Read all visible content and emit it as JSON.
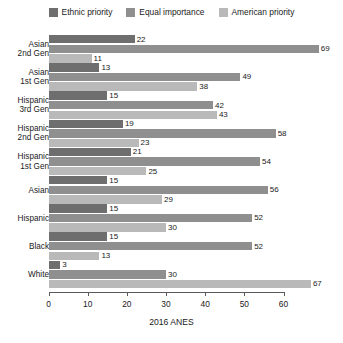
{
  "legend": {
    "position": "top-center",
    "items": [
      {
        "label": "Ethnic priority",
        "color": "#6e6e6e",
        "icon": "square-swatch-icon"
      },
      {
        "label": "Equal importance",
        "color": "#8f8f8f",
        "icon": "square-swatch-icon"
      },
      {
        "label": "American priority",
        "color": "#b9b9b9",
        "icon": "square-swatch-icon"
      }
    ]
  },
  "axis": {
    "title": "2016 ANES",
    "ticks": [
      0,
      10,
      20,
      30,
      40,
      50,
      60
    ],
    "min": 0,
    "max": 60,
    "pixels": {
      "origin_x": 48.5,
      "units_per_px": 3.917
    }
  },
  "chart_data": {
    "type": "bar",
    "orientation": "horizontal",
    "title": "",
    "subtitle": "",
    "xlabel": "2016 ANES",
    "ylabel": "",
    "xlim": [
      0,
      60
    ],
    "grid": false,
    "legend_position": "top-center",
    "categories": [
      "Asian\n2nd Gen",
      "Asian\n1st Gen",
      "Hispanic\n3rd Gen",
      "Hispanic\n2nd Gen",
      "Hispanic\n1st Gen",
      "Asian",
      "Hispanic",
      "Black",
      "White"
    ],
    "series": [
      {
        "name": "Ethnic priority",
        "color": "#6e6e6e",
        "values": [
          22,
          13,
          15,
          19,
          21,
          15,
          15,
          15,
          3
        ]
      },
      {
        "name": "Equal importance",
        "color": "#8f8f8f",
        "values": [
          69,
          49,
          42,
          58,
          54,
          56,
          52,
          52,
          30
        ]
      },
      {
        "name": "American priority",
        "color": "#b9b9b9",
        "values": [
          11,
          38,
          43,
          23,
          25,
          29,
          30,
          13,
          67
        ]
      }
    ]
  }
}
